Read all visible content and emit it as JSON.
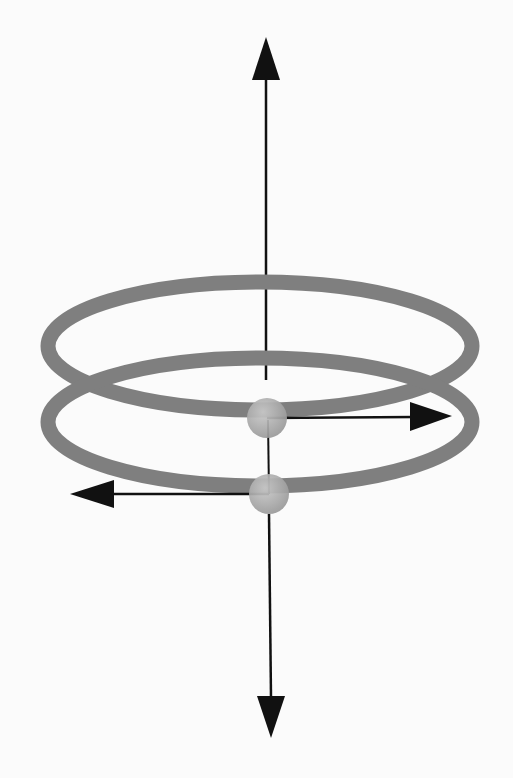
{
  "diagram": {
    "colors": {
      "background": "#fbfbfb",
      "ring": "#7f7f7f",
      "sphere": "#a8a8a8",
      "arrow": "#111111"
    },
    "rings": [
      {
        "name": "upper-ring",
        "cx": 260,
        "cy": 346,
        "rx": 212,
        "ry": 64
      },
      {
        "name": "lower-ring",
        "cx": 260,
        "cy": 422,
        "rx": 212,
        "ry": 64
      }
    ],
    "spheres": [
      {
        "name": "upper-sphere",
        "cx": 267,
        "cy": 418,
        "r": 20
      },
      {
        "name": "lower-sphere",
        "cx": 269,
        "cy": 494,
        "r": 20
      }
    ],
    "arrows": [
      {
        "name": "axis-up-arrow",
        "x1": 266,
        "y1": 380,
        "x2": 266,
        "y2": 38
      },
      {
        "name": "axis-down-arrow",
        "x1": 269,
        "y1": 440,
        "x2": 271,
        "y2": 738
      },
      {
        "name": "right-arrow",
        "x1": 287,
        "y1": 418,
        "x2": 452,
        "y2": 416
      },
      {
        "name": "left-arrow",
        "x1": 250,
        "y1": 494,
        "x2": 70,
        "y2": 494
      }
    ]
  }
}
